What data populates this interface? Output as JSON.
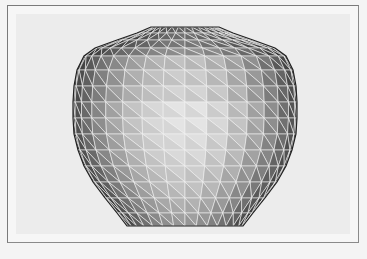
{
  "figure": {
    "colors": {
      "page_background": "#f4f4f4",
      "frame_border": "#7a7a7a",
      "panel_background": "#ececec",
      "wire": "#f2f2f2"
    },
    "mesh": {
      "center_x": 185,
      "columns": 16,
      "rings": [
        {
          "y": 27,
          "r": 34
        },
        {
          "y": 33,
          "r": 48
        },
        {
          "y": 40,
          "r": 68
        },
        {
          "y": 48,
          "r": 90
        },
        {
          "y": 56,
          "r": 101
        },
        {
          "y": 70,
          "r": 108
        },
        {
          "y": 86,
          "r": 111
        },
        {
          "y": 102,
          "r": 112
        },
        {
          "y": 118,
          "r": 112
        },
        {
          "y": 134,
          "r": 111
        },
        {
          "y": 150,
          "r": 107
        },
        {
          "y": 166,
          "r": 101
        },
        {
          "y": 182,
          "r": 92
        },
        {
          "y": 198,
          "r": 80
        },
        {
          "y": 213,
          "r": 68
        },
        {
          "y": 226,
          "r": 58
        }
      ],
      "column_shades": [
        "#3a3a3a",
        "#555555",
        "#707070",
        "#8e8e8e",
        "#aaaaaa",
        "#c4c4c4",
        "#d8d8d8",
        "#e4e4e4",
        "#e4e4e4",
        "#d8d8d8",
        "#c4c4c4",
        "#aaaaaa",
        "#8e8e8e",
        "#707070",
        "#555555",
        "#3a3a3a"
      ],
      "ring_shade_factor": [
        0.45,
        0.5,
        0.55,
        0.65,
        0.85,
        0.9,
        0.93,
        1.0,
        1.0,
        0.98,
        0.95,
        0.9,
        0.85,
        0.78,
        0.7,
        0.62
      ]
    }
  }
}
